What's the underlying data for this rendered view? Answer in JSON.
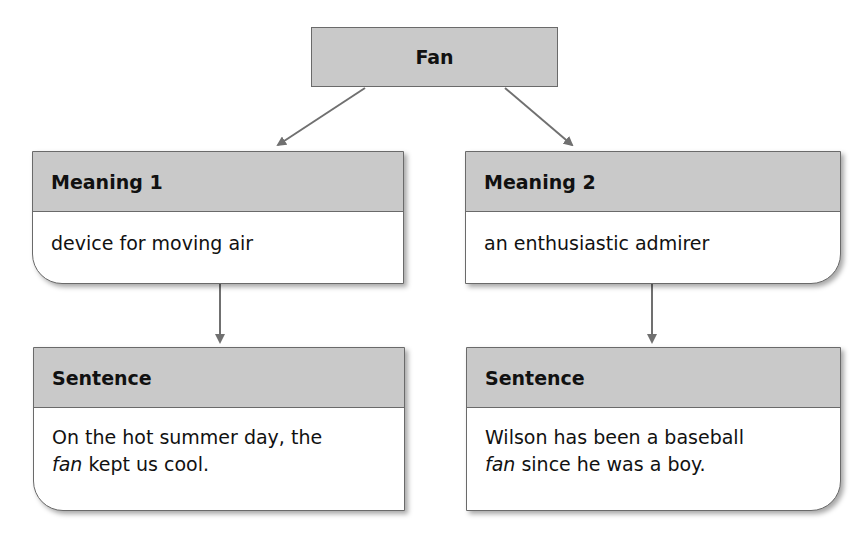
{
  "diagram": {
    "root": {
      "label": "Fan"
    },
    "branches": [
      {
        "meaning": {
          "header": "Meaning 1",
          "text": "device for moving air"
        },
        "sentence": {
          "header": "Sentence",
          "text_before": "On the hot summer day, the ",
          "italic_word": "fan",
          "text_after": " kept us cool."
        }
      },
      {
        "meaning": {
          "header": "Meaning 2",
          "text": "an enthusiastic admirer"
        },
        "sentence": {
          "header": "Sentence",
          "text_before": "Wilson has been a baseball ",
          "italic_word": "fan",
          "text_after": " since he was a boy."
        }
      }
    ]
  },
  "colors": {
    "header_fill": "#c9c9c9",
    "border": "#6a6a6a",
    "arrow": "#707070",
    "background": "#ffffff"
  }
}
